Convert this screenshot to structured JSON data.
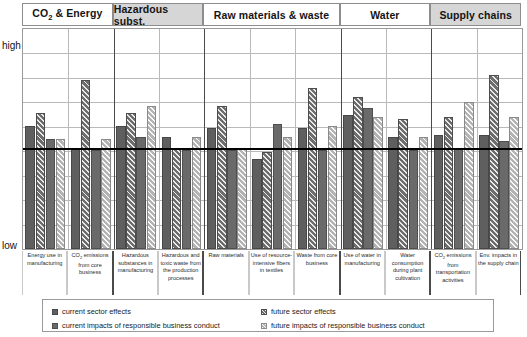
{
  "chart_data": {
    "type": "bar",
    "title": "",
    "subtitle": "",
    "xlabel": "",
    "ylabel": "",
    "ylim": [
      0,
      100
    ],
    "y_tick_labels": [
      "low",
      "high"
    ],
    "grid": true,
    "legend_position": "bottom",
    "annotations": [
      {
        "name": "threshold-line",
        "type": "horizontal-line",
        "value": 45,
        "color": "#000000"
      }
    ],
    "groups": [
      {
        "label": "CO2 & Energy",
        "shaded": false,
        "categories": [
          0,
          1
        ]
      },
      {
        "label": "Hazardous subst.",
        "shaded": true,
        "categories": [
          2,
          3
        ]
      },
      {
        "label": "Raw materials & waste",
        "shaded": false,
        "categories": [
          4,
          5,
          6
        ]
      },
      {
        "label": "Water",
        "shaded": false,
        "categories": [
          7,
          8
        ]
      },
      {
        "label": "Supply chains",
        "shaded": true,
        "categories": [
          9,
          10
        ]
      }
    ],
    "categories": [
      "Energy use in manufacturing",
      "CO2 emissions from core business",
      "Hazardous substances in manufacturing",
      "Hazardous and toxic waste from the production processes",
      "Raw materials",
      "Use of resource-intensive fibers in textiles",
      "Waste from core business",
      "Use of water in manufacturing",
      "Water consumption during plant cultivation",
      "CO2 emissions from transportation activities",
      "Env. impacts in the supply chain"
    ],
    "series": [
      {
        "name": "current sector effects",
        "swatch": "solid-dark-grey",
        "color": "#5f5f5f",
        "values": [
          56,
          46,
          56,
          51,
          55,
          41,
          55,
          61,
          51,
          52,
          52
        ]
      },
      {
        "name": "future sector effects",
        "swatch": "hatched-dark-grey",
        "color": "#6d6d6d",
        "values": [
          62,
          77,
          62,
          46,
          65,
          44,
          73,
          69,
          59,
          60,
          79
        ]
      },
      {
        "name": "current impacts of responsible business conduct",
        "swatch": "solid-medium-grey",
        "color": "#6a6a6a",
        "values": [
          50,
          45,
          51,
          45,
          45,
          57,
          45,
          64,
          45,
          46,
          49
        ]
      },
      {
        "name": "future impacts of responsible business conduct",
        "swatch": "hatched-light-grey",
        "color": "#b3b3b3",
        "values": [
          50,
          50,
          65,
          51,
          46,
          51,
          56,
          60,
          51,
          67,
          60
        ]
      }
    ]
  },
  "axis": {
    "high_label": "high",
    "low_label": "low"
  },
  "legend": {
    "items": [
      {
        "label": "current sector effects",
        "swatch_class": "lg0"
      },
      {
        "label": "future sector effects",
        "swatch_class": "lg1"
      },
      {
        "label": "current impacts of responsible business conduct",
        "swatch_class": "lg2"
      },
      {
        "label": "future impacts of responsible business conduct",
        "swatch_class": "lg3"
      }
    ]
  }
}
